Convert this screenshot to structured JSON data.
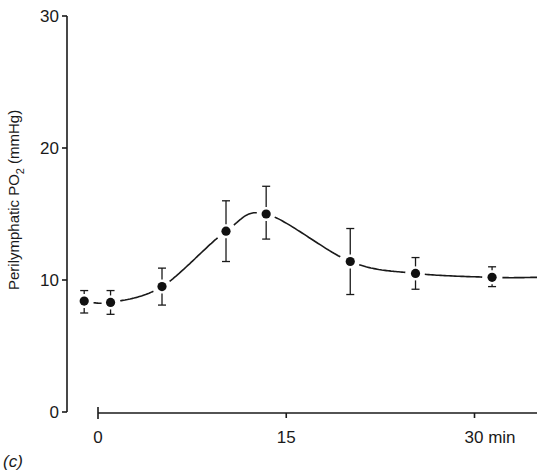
{
  "chart_data": {
    "type": "line",
    "title": "",
    "panel_label": "(c)",
    "xlabel": "min",
    "ylabel": "Perilymphatic PO",
    "ylabel_subscript": "2",
    "ylabel_unit": "(mmHg)",
    "xlim": [
      0,
      35
    ],
    "ylim": [
      0,
      30
    ],
    "x_ticks": [
      0,
      15,
      30
    ],
    "x_tick_labels": [
      "0",
      "15",
      "30 min"
    ],
    "y_ticks": [
      0,
      10,
      20,
      30
    ],
    "y_tick_labels": [
      "0",
      "10",
      "20",
      "30"
    ],
    "grid": false,
    "legend": "none",
    "series": [
      {
        "name": "Perilymphatic PO2",
        "marker": "filled-circle",
        "x": [
          -1.1,
          1.0,
          5.1,
          10.2,
          13.4,
          20.1,
          25.3,
          31.4
        ],
        "y": [
          8.4,
          8.3,
          9.5,
          13.7,
          15.0,
          11.4,
          10.5,
          10.2
        ],
        "err_low": [
          7.5,
          7.4,
          8.1,
          11.4,
          13.1,
          8.9,
          9.3,
          9.5
        ],
        "err_high": [
          9.2,
          9.2,
          10.9,
          16.0,
          17.1,
          13.9,
          11.7,
          11.0
        ]
      }
    ],
    "curve_end": {
      "x": 35.0,
      "y": 10.2
    }
  }
}
